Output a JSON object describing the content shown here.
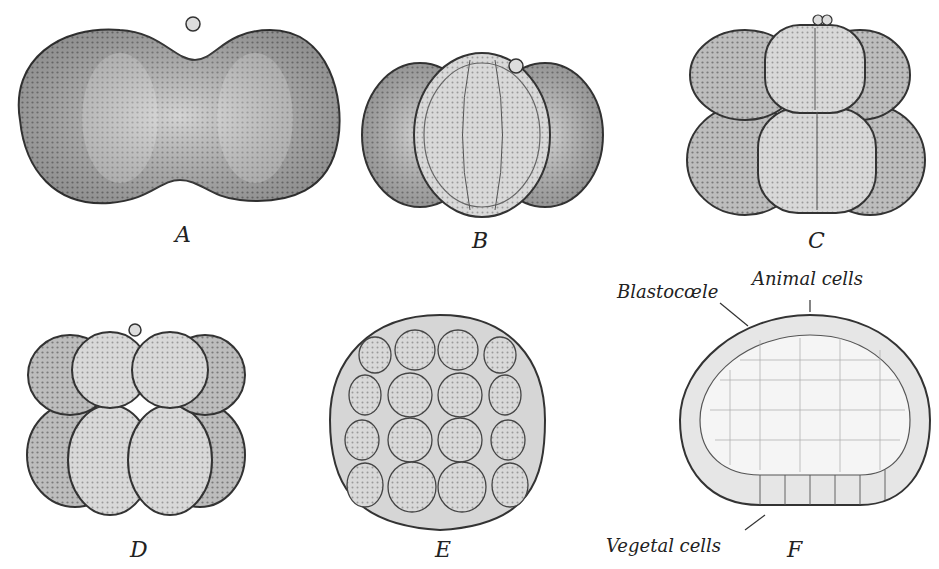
{
  "figure": {
    "panels": [
      {
        "id": "A",
        "label": "A",
        "description": "2-cell stage"
      },
      {
        "id": "B",
        "label": "B",
        "description": "4-cell stage"
      },
      {
        "id": "C",
        "label": "C",
        "description": "8-cell stage"
      },
      {
        "id": "D",
        "label": "D",
        "description": "16-cell stage"
      },
      {
        "id": "E",
        "label": "E",
        "description": "morula / early blastula"
      },
      {
        "id": "F",
        "label": "F",
        "description": "blastula section"
      }
    ],
    "annotations": {
      "blastocoele": "Blastocœle",
      "animal_cells": "Animal cells",
      "vegetal_cells": "Vegetal cells"
    },
    "colors": {
      "cell_fill": "#b9b9b9",
      "cell_light": "#dcdcdc",
      "outline": "#333333",
      "cavity": "#f3f3f3"
    }
  }
}
